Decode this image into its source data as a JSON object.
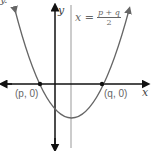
{
  "diagram": {
    "type": "parabola",
    "corner_label": "y.",
    "axes": {
      "x_label": "x",
      "y_label": "y"
    },
    "axis_of_symmetry": {
      "lhs": "x =",
      "numerator": "p + q",
      "denominator": "2"
    },
    "points": [
      {
        "label": "(p, 0)"
      },
      {
        "label": "(q, 0)"
      }
    ],
    "colors": {
      "curve": "#666666",
      "axes": "#111111",
      "symmetry_line": "#999999"
    }
  }
}
